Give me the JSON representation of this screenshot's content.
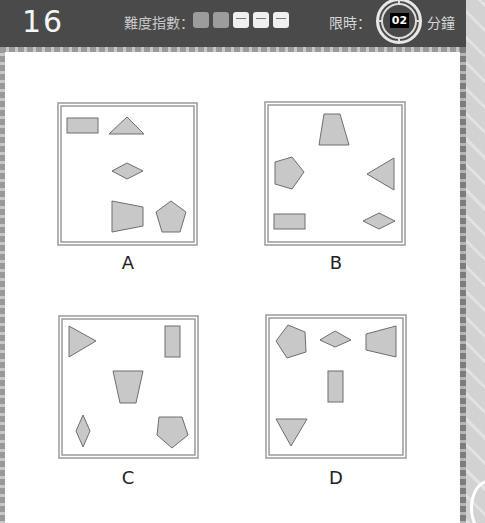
{
  "header": {
    "page_number": "16",
    "difficulty_label": "難度指數：",
    "difficulty": {
      "filled": 2,
      "total": 5
    },
    "time_limit_label": "限時：",
    "time_limit_value": "02",
    "time_unit": "分鐘"
  },
  "options": [
    {
      "label": "A",
      "box": [
        58,
        103,
        139,
        142
      ]
    },
    {
      "label": "B",
      "box": [
        265,
        102,
        140,
        143
      ]
    },
    {
      "label": "C",
      "box": [
        59,
        316,
        139,
        142
      ]
    },
    {
      "label": "D",
      "box": [
        266,
        315,
        140,
        143
      ]
    }
  ],
  "colors": {
    "header_bg": "#4a4a4a",
    "shape_fill": "#c8c8c8",
    "shape_stroke": "#6e6e6e",
    "box_border": "#9a9a9a"
  }
}
